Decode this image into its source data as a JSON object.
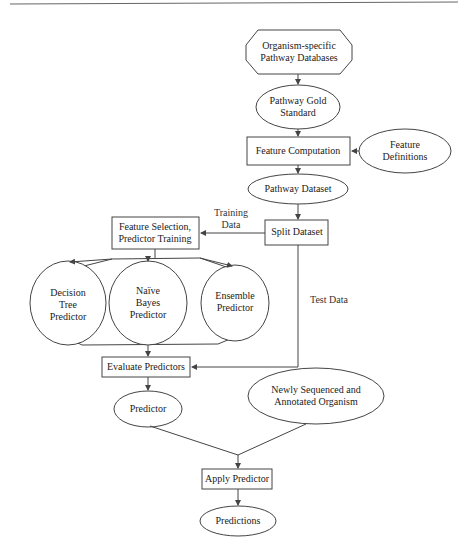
{
  "header": {
    "rule": true
  },
  "nodes": {
    "databases": {
      "lines": [
        "Organism-specific",
        "Pathway Databases"
      ],
      "shape": "octagon"
    },
    "gold_standard": {
      "lines": [
        "Pathway Gold",
        "Standard"
      ],
      "shape": "ellipse"
    },
    "feature_computation": {
      "lines": [
        "Feature Computation"
      ],
      "shape": "rectangle"
    },
    "feature_definitions": {
      "lines": [
        "Feature",
        "Definitions"
      ],
      "shape": "ellipse"
    },
    "pathway_dataset": {
      "lines": [
        "Pathway Dataset"
      ],
      "shape": "ellipse"
    },
    "split_dataset": {
      "lines": [
        "Split Dataset"
      ],
      "shape": "rectangle"
    },
    "feature_selection": {
      "lines": [
        "Feature Selection,",
        "Predictor Training"
      ],
      "shape": "rectangle"
    },
    "decision_tree": {
      "lines": [
        "Decision",
        "Tree",
        "Predictor"
      ],
      "shape": "ellipse"
    },
    "naive_bayes": {
      "lines": [
        "Naïve",
        "Bayes",
        "Predictor"
      ],
      "shape": "ellipse"
    },
    "ensemble": {
      "lines": [
        "Ensemble",
        "Predictor"
      ],
      "shape": "ellipse"
    },
    "evaluate": {
      "lines": [
        "Evaluate Predictors"
      ],
      "shape": "rectangle"
    },
    "predictor": {
      "lines": [
        "Predictor"
      ],
      "shape": "ellipse"
    },
    "new_organism": {
      "lines": [
        "Newly Sequenced and",
        "Annotated Organism"
      ],
      "shape": "ellipse"
    },
    "apply": {
      "lines": [
        "Apply Predictor"
      ],
      "shape": "rectangle"
    },
    "predictions": {
      "lines": [
        "Predictions"
      ],
      "shape": "ellipse"
    }
  },
  "edge_labels": {
    "training": [
      "Training",
      "Data"
    ],
    "test": [
      "Test Data"
    ]
  },
  "colors": {
    "stroke": "#444444",
    "text": "#222222",
    "background": "#ffffff"
  }
}
